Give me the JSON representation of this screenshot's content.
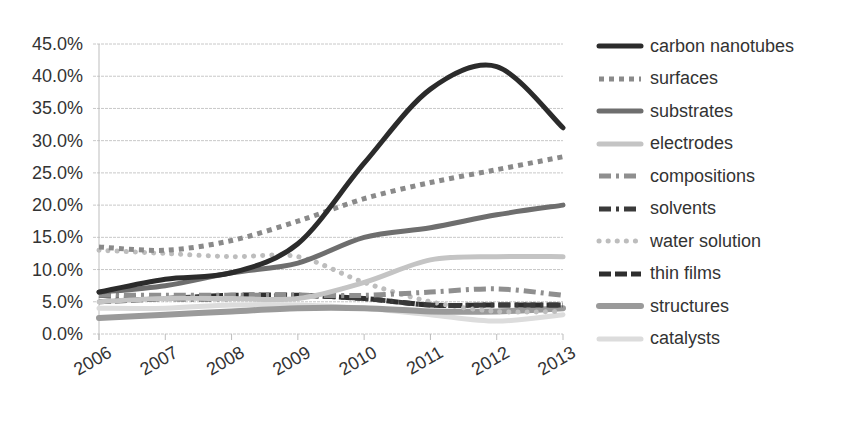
{
  "chart_data": {
    "type": "line",
    "title": "",
    "xlabel": "",
    "ylabel": "",
    "ylim": [
      0,
      45
    ],
    "y_ticks": [
      "0.0%",
      "5.0%",
      "10.0%",
      "15.0%",
      "20.0%",
      "25.0%",
      "30.0%",
      "35.0%",
      "40.0%",
      "45.0%"
    ],
    "categories": [
      "2006",
      "2007",
      "2008",
      "2009",
      "2010",
      "2011",
      "2012",
      "2013"
    ],
    "grid": true,
    "legend_position": "right",
    "series": [
      {
        "name": "carbon nanotubes",
        "color": "#2b2b2b",
        "style": "solid",
        "width": 5,
        "values": [
          6.5,
          8.5,
          9.5,
          14,
          26.5,
          38,
          41.5,
          32
        ]
      },
      {
        "name": "surfaces",
        "color": "#8a8a8a",
        "style": "square-dot",
        "width": 5,
        "values": [
          13.5,
          13,
          14.5,
          17.5,
          21,
          23.5,
          25.5,
          27.5
        ]
      },
      {
        "name": "substrates",
        "color": "#6e6e6e",
        "style": "solid",
        "width": 5,
        "values": [
          6.5,
          7.5,
          9.5,
          11,
          15,
          16.5,
          18.5,
          20
        ]
      },
      {
        "name": "electrodes",
        "color": "#c4c4c4",
        "style": "solid",
        "width": 5,
        "values": [
          5,
          5.5,
          5.5,
          5.5,
          8,
          11.5,
          12,
          12
        ]
      },
      {
        "name": "compositions",
        "color": "#8f8f8f",
        "style": "dash-dot",
        "width": 5,
        "values": [
          6,
          6,
          6,
          6,
          6,
          6.5,
          7,
          6
        ]
      },
      {
        "name": "solvents",
        "color": "#3a3a3a",
        "style": "dash-dot",
        "width": 5,
        "values": [
          6,
          5.5,
          5.5,
          6,
          5.5,
          4.5,
          4.5,
          4.5
        ]
      },
      {
        "name": "water solution",
        "color": "#bdbdbd",
        "style": "round-dot",
        "width": 5,
        "values": [
          13,
          12.5,
          12,
          12,
          8,
          5,
          3.5,
          3.5
        ]
      },
      {
        "name": "thin films",
        "color": "#2e2e2e",
        "style": "dash",
        "width": 5,
        "values": [
          5,
          5.5,
          6,
          6,
          5.5,
          4.5,
          4.5,
          4.5
        ]
      },
      {
        "name": "structures",
        "color": "#9a9a9a",
        "style": "solid",
        "width": 6,
        "values": [
          2.5,
          3,
          3.5,
          4,
          4,
          3.5,
          3.5,
          4
        ]
      },
      {
        "name": "catalysts",
        "color": "#dcdcdc",
        "style": "solid",
        "width": 5,
        "values": [
          4,
          4,
          4.5,
          4.5,
          4,
          3,
          2,
          3
        ]
      }
    ]
  }
}
